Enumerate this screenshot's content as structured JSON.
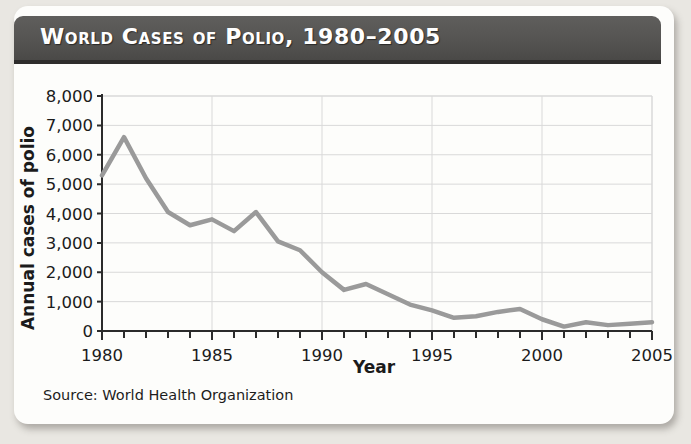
{
  "card": {
    "title": "World Cases of Polio, 1980–2005",
    "source": "Source: World Health Organization"
  },
  "colors": {
    "banner": "#555452",
    "banner_shadow": "#2e2d2c",
    "title_text": "#fefefe",
    "line": "#9a9a9a",
    "grid": "#d9d9d9",
    "axis": "#2b2b2b",
    "card_background": "#fdfdfb",
    "page_background": "#e9e7e2"
  },
  "chart_data": {
    "type": "line",
    "title": "World Cases of Polio, 1980–2005",
    "xlabel": "Year",
    "ylabel": "Annual cases of polio",
    "xlim": [
      1980,
      2005
    ],
    "ylim": [
      0,
      8000
    ],
    "grid": true,
    "legend": "none",
    "x_tick_labels": [
      "1980",
      "1985",
      "1990",
      "1995",
      "2000",
      "2005"
    ],
    "x_tick_values": [
      1980,
      1985,
      1990,
      1995,
      2000,
      2005
    ],
    "x_minor_tick_interval": 1,
    "y_tick_labels": [
      "0",
      "1,000",
      "2,000",
      "3,000",
      "4,000",
      "5,000",
      "6,000",
      "7,000",
      "8,000"
    ],
    "y_tick_values": [
      0,
      1000,
      2000,
      3000,
      4000,
      5000,
      6000,
      7000,
      8000
    ],
    "series": [
      {
        "name": "Annual cases of polio",
        "color": "#9a9a9a",
        "x": [
          1980,
          1981,
          1982,
          1983,
          1984,
          1985,
          1986,
          1987,
          1988,
          1989,
          1990,
          1991,
          1992,
          1993,
          1994,
          1995,
          1996,
          1997,
          1998,
          1999,
          2000,
          2001,
          2002,
          2003,
          2004,
          2005
        ],
        "values": [
          5300,
          6600,
          5200,
          4050,
          3600,
          3800,
          3400,
          4050,
          3050,
          2750,
          2000,
          1400,
          1600,
          1250,
          900,
          700,
          450,
          500,
          650,
          750,
          400,
          150,
          300,
          200,
          250,
          300
        ]
      }
    ],
    "annotations": [
      "Source: World Health Organization"
    ]
  }
}
